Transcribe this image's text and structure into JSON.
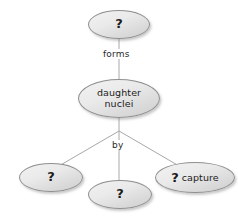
{
  "diagram": {
    "background_color": "#ffffff",
    "node_fill_light": "#f2f2f2",
    "node_fill_dark": "#cfcfcf",
    "node_border_color": "#8f8f8f",
    "edge_color": "#a8a8a8",
    "text_color": "#1b1b1b",
    "nodes": [
      {
        "id": "top",
        "label": "?",
        "kind": "question"
      },
      {
        "id": "daughter",
        "label": "daughter\nnuclei",
        "kind": "text"
      },
      {
        "id": "bottom_left",
        "label": "?",
        "kind": "question"
      },
      {
        "id": "bottom_mid",
        "label": "?",
        "kind": "question"
      },
      {
        "id": "bottom_right",
        "label_symbol": "?",
        "label_word": "capture",
        "kind": "mixed"
      }
    ],
    "edge_labels": [
      {
        "id": "forms",
        "text": "forms"
      },
      {
        "id": "by",
        "text": "by"
      }
    ]
  }
}
